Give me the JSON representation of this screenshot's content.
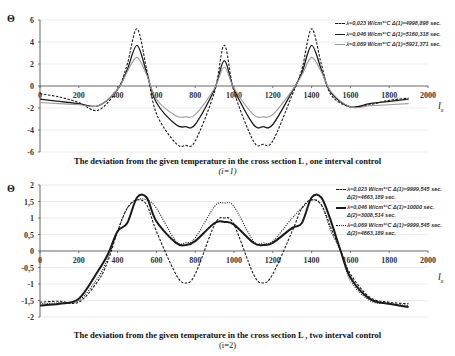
{
  "chart_data": [
    {
      "type": "line",
      "title": "The deviation from the given temperature in the cross section L, one interval control",
      "subtitle": "(i=1)",
      "xlabel": "l_x",
      "ylabel": "Θ",
      "xlim": [
        0,
        2000
      ],
      "ylim": [
        -6,
        6
      ],
      "x_ticks": [
        "0",
        "200",
        "400",
        "600",
        "800",
        "1000",
        "1200",
        "1400",
        "1600",
        "1800",
        "2000"
      ],
      "y_ticks": [
        "6",
        "4",
        "2",
        "0",
        "-2",
        "-4",
        "-6"
      ],
      "grid": true,
      "legend_position": "top-right",
      "x": [
        0,
        100,
        200,
        300,
        400,
        450,
        500,
        550,
        600,
        700,
        750,
        800,
        900,
        950,
        1000,
        1100,
        1150,
        1200,
        1300,
        1350,
        1400,
        1450,
        1500,
        1600,
        1700,
        1800,
        1900
      ],
      "series": [
        {
          "name": "λ=0,023 W/cm*°C Δ(1)=4998,898 sec.",
          "style": "dashed",
          "values": [
            -0.7,
            -1.0,
            -1.5,
            -2.2,
            -0.3,
            2.0,
            5.2,
            1.5,
            -2.5,
            -5.2,
            -5.4,
            -5.0,
            -0.5,
            3.7,
            -0.5,
            -5.0,
            -5.3,
            -5.0,
            -0.8,
            1.5,
            5.2,
            2.0,
            -0.8,
            -1.9,
            -1.7,
            -1.3,
            -1.1
          ]
        },
        {
          "name": "λ=0,046 W/cm*°C Δ(1)=5160,318 sec.",
          "style": "solid-dark",
          "values": [
            -1.2,
            -1.4,
            -1.6,
            -1.8,
            -0.3,
            1.5,
            3.7,
            1.2,
            -1.5,
            -3.5,
            -3.7,
            -3.5,
            -0.3,
            2.3,
            -0.3,
            -3.5,
            -3.7,
            -3.5,
            -0.5,
            1.2,
            3.7,
            1.5,
            -0.6,
            -1.9,
            -1.6,
            -1.4,
            -1.2
          ]
        },
        {
          "name": "λ=0,069 W/cm*°C Δ(1)=5921,371 sec.",
          "style": "solid-light",
          "values": [
            -1.5,
            -1.6,
            -1.7,
            -1.8,
            -0.3,
            1.3,
            2.6,
            1.0,
            -1.2,
            -2.7,
            -2.8,
            -2.6,
            -0.2,
            1.7,
            -0.2,
            -2.6,
            -2.8,
            -2.6,
            -0.4,
            1.0,
            2.6,
            1.3,
            -0.5,
            -1.9,
            -1.8,
            -1.7,
            -1.6
          ]
        }
      ]
    },
    {
      "type": "line",
      "title": "The deviation from the given temperature in the cross section L, two interval control",
      "subtitle": "(i=2)",
      "xlabel": "l_x",
      "ylabel": "Θ",
      "xlim": [
        0,
        2000
      ],
      "ylim": [
        -2,
        2
      ],
      "x_ticks": [
        "0",
        "200",
        "400",
        "600",
        "800",
        "1000",
        "1200",
        "1400",
        "1600",
        "1800",
        "2000"
      ],
      "y_ticks": [
        "2",
        "1,5",
        "1",
        "0,5",
        "0",
        "-0,5",
        "-1",
        "-1,5",
        "-2"
      ],
      "grid": true,
      "legend_position": "top-right",
      "x": [
        0,
        100,
        200,
        300,
        350,
        400,
        450,
        500,
        550,
        600,
        700,
        750,
        800,
        900,
        950,
        1000,
        1100,
        1150,
        1200,
        1300,
        1350,
        1400,
        1450,
        1500,
        1550,
        1600,
        1700,
        1800,
        1900
      ],
      "series": [
        {
          "name": "λ=0,023 W/cm*°C Δ(1)=9999,545 sec. Δ(2)=4663,189 sec.",
          "style": "dashed",
          "values": [
            -1.55,
            -1.52,
            -1.55,
            -0.9,
            -0.3,
            0.6,
            1.3,
            1.55,
            1.4,
            0.6,
            -0.7,
            -0.97,
            -0.7,
            0.8,
            1.0,
            0.8,
            -0.7,
            -0.97,
            -0.7,
            0.6,
            1.3,
            1.55,
            1.4,
            0.7,
            0.0,
            -0.7,
            -1.4,
            -1.55,
            -1.6
          ]
        },
        {
          "name": "λ=0,046 W/cm*°C Δ(1)=10000 sec. Δ(2)=3008,514 sec.",
          "style": "solid-thick",
          "values": [
            -1.65,
            -1.6,
            -1.45,
            -0.6,
            -0.1,
            0.6,
            0.85,
            1.62,
            1.62,
            0.9,
            0.25,
            0.18,
            0.3,
            0.85,
            0.88,
            0.8,
            0.25,
            0.18,
            0.25,
            0.7,
            0.85,
            1.62,
            1.62,
            0.9,
            0.0,
            -0.8,
            -1.45,
            -1.6,
            -1.7
          ]
        },
        {
          "name": "λ=0,069 W/cm*°C Δ(1)=9999,545 sec. Δ(2)=4663,189 sec.",
          "style": "dotted",
          "values": [
            -1.6,
            -1.57,
            -1.5,
            -0.8,
            -0.2,
            0.6,
            1.3,
            1.55,
            1.55,
            1.3,
            0.3,
            0.25,
            0.4,
            1.35,
            1.45,
            1.35,
            0.3,
            0.25,
            0.3,
            1.0,
            1.3,
            1.55,
            1.4,
            0.6,
            0.0,
            -0.9,
            -1.5,
            -1.6,
            -1.65
          ]
        }
      ]
    }
  ],
  "top": {
    "ylabel": "Θ",
    "xlabel_main": "l",
    "xlabel_sub": "x",
    "legend": [
      {
        "label": "λ=0,023 W/cm*°C Δ(1)=4998,898 sec."
      },
      {
        "label": "λ=0,046 W/cm*°C Δ(1)=5160,318 sec."
      },
      {
        "label": "λ=0,069 W/cm*°C Δ(1)=5921,371 sec."
      }
    ],
    "caption": "The deviation from the given temperature in the cross section L , one interval control",
    "caption_sub": "(i=1)"
  },
  "bottom": {
    "ylabel": "Θ",
    "xlabel_main": "l",
    "xlabel_sub": "x",
    "legend": [
      {
        "label": "λ=0,023 W/cm*°C Δ(1)=9999,545 sec. Δ(2)=4663,189 sec."
      },
      {
        "label": "λ=0,046 W/cm*°C Δ(1)=10000 sec. Δ(2)=3008,514 sec."
      },
      {
        "label": "λ=0,069 W/cm*°C Δ(1)=9999,545 sec. Δ(2)=4663,189 sec."
      }
    ],
    "caption": "The deviation from the given temperature in the cross section L , two interval control",
    "caption_sub": "(i=2)"
  },
  "colors": {
    "series_dark": "#1a1a1a",
    "series_light": "#9a9a9a",
    "grid": "#e6e6e6",
    "axis": "#555555"
  }
}
